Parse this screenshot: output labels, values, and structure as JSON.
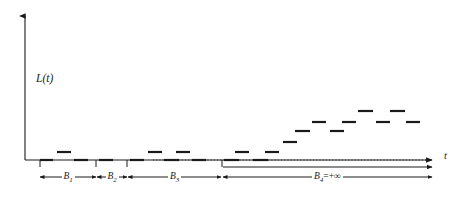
{
  "figure": {
    "title": "",
    "y_axis_label": "L(t)",
    "x_axis_label": "t",
    "background_color": "#ffffff",
    "ink_color": "#1a1a1a"
  },
  "brackets": [
    {
      "id": "B1",
      "label_base": "B",
      "label_sub": "1",
      "label_suffix": "",
      "x_start": 40,
      "x_end": 96
    },
    {
      "id": "B2",
      "label_base": "B",
      "label_sub": "2",
      "label_suffix": "",
      "x_start": 97,
      "x_end": 127
    },
    {
      "id": "B3",
      "label_base": "B",
      "label_sub": "3",
      "label_suffix": "",
      "x_start": 128,
      "x_end": 221
    },
    {
      "id": "B4",
      "label_base": "B",
      "label_sub": "4",
      "label_suffix": "=+∞",
      "x_start": 223,
      "x_end": 432
    }
  ],
  "chart_data": {
    "type": "line",
    "title": "",
    "xlabel": "t",
    "ylabel": "L(t)",
    "grid": false,
    "legend": false,
    "axis": {
      "origin_x": 25,
      "origin_y": 160,
      "x_axis_end": 437,
      "y_axis_top": 12,
      "baseline_level": 0
    },
    "baseline": {
      "style": "dotted",
      "y_level": 0,
      "x_from": 153,
      "x_to": 432
    },
    "ticks": [
      {
        "x": 40
      },
      {
        "x": 96
      },
      {
        "x": 127
      },
      {
        "x": 222
      }
    ],
    "series": [
      {
        "name": "L(t)",
        "style": "dashes",
        "segments": [
          {
            "x0": 40,
            "x1": 53,
            "level": 0
          },
          {
            "x0": 57,
            "x1": 71,
            "level": 1
          },
          {
            "x0": 74,
            "x1": 88,
            "level": 0
          },
          {
            "x0": 99,
            "x1": 113,
            "level": 0
          },
          {
            "x0": 130,
            "x1": 144,
            "level": 0
          },
          {
            "x0": 148,
            "x1": 162,
            "level": 1
          },
          {
            "x0": 164,
            "x1": 179,
            "level": 0
          },
          {
            "x0": 176,
            "x1": 190,
            "level": 1
          },
          {
            "x0": 192,
            "x1": 206,
            "level": 0
          },
          {
            "x0": 224,
            "x1": 239,
            "level": 0
          },
          {
            "x0": 235,
            "x1": 249,
            "level": 1
          },
          {
            "x0": 253,
            "x1": 268,
            "level": 0
          },
          {
            "x0": 265,
            "x1": 279,
            "level": 1
          },
          {
            "x0": 283,
            "x1": 297,
            "level": 2
          },
          {
            "x0": 295,
            "x1": 310,
            "level": 3
          },
          {
            "x0": 312,
            "x1": 326,
            "level": 4
          },
          {
            "x0": 330,
            "x1": 344,
            "level": 3
          },
          {
            "x0": 342,
            "x1": 356,
            "level": 4
          },
          {
            "x0": 358,
            "x1": 373,
            "level": 5
          },
          {
            "x0": 376,
            "x1": 390,
            "level": 4
          },
          {
            "x0": 390,
            "x1": 405,
            "level": 5
          },
          {
            "x0": 406,
            "x1": 420,
            "level": 4
          }
        ],
        "level_pixel_y": {
          "0": 160,
          "1": 152,
          "2": 142,
          "3": 131,
          "4": 122,
          "5": 111
        }
      }
    ]
  }
}
